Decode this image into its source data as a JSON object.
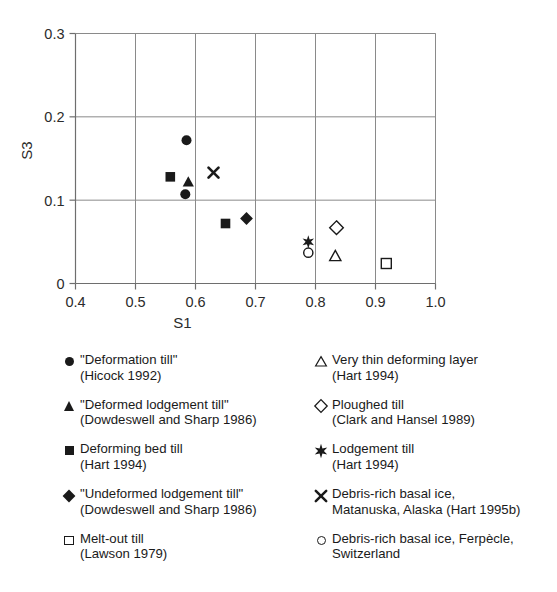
{
  "chart_data": {
    "type": "scatter",
    "title": "",
    "xlabel": "S1",
    "ylabel": "S3",
    "xlim": [
      0.4,
      1.0
    ],
    "ylim": [
      0.0,
      0.3
    ],
    "xticks": [
      "0.4",
      "0.5",
      "0.6",
      "0.7",
      "0.8",
      "0.9",
      "1.0"
    ],
    "yticks": [
      "0",
      "0.1",
      "0.2",
      "0.3"
    ],
    "grid": true,
    "legend_position": "below-plot-two-columns",
    "series": [
      {
        "name": "\"Deformation till\" (Hicock 1992)",
        "marker": "circle-filled",
        "points": [
          {
            "x": 0.585,
            "y": 0.172
          },
          {
            "x": 0.583,
            "y": 0.107
          }
        ]
      },
      {
        "name": "\"Deformed lodgement till\" (Dowdeswell and Sharp 1986)",
        "marker": "triangle-filled",
        "points": [
          {
            "x": 0.588,
            "y": 0.122
          }
        ]
      },
      {
        "name": "Deforming bed till (Hart 1994)",
        "marker": "square-filled",
        "points": [
          {
            "x": 0.558,
            "y": 0.128
          },
          {
            "x": 0.65,
            "y": 0.072
          }
        ]
      },
      {
        "name": "\"Undeformed lodgement till\" (Dowdeswell and Sharp 1986)",
        "marker": "diamond-filled",
        "points": [
          {
            "x": 0.685,
            "y": 0.078
          }
        ]
      },
      {
        "name": "Melt-out till (Lawson 1979)",
        "marker": "square-open",
        "points": [
          {
            "x": 0.918,
            "y": 0.024
          }
        ]
      },
      {
        "name": "Very thin deforming layer (Hart 1994)",
        "marker": "triangle-open",
        "points": [
          {
            "x": 0.833,
            "y": 0.033
          }
        ]
      },
      {
        "name": "Ploughed till (Clark and Hansel 1989)",
        "marker": "diamond-open",
        "points": [
          {
            "x": 0.835,
            "y": 0.067
          }
        ]
      },
      {
        "name": "Lodgement till (Hart 1994)",
        "marker": "star",
        "points": [
          {
            "x": 0.788,
            "y": 0.05
          }
        ]
      },
      {
        "name": "Debris-rich basal ice, Matanuska, Alaska (Hart 1995b)",
        "marker": "ex",
        "points": [
          {
            "x": 0.63,
            "y": 0.133
          }
        ]
      },
      {
        "name": "Debris-rich basal ice, Ferpècle, Switzerland",
        "marker": "circle-open",
        "points": [
          {
            "x": 0.788,
            "y": 0.037
          }
        ]
      }
    ]
  },
  "axes": {
    "x_title": "S1",
    "y_title": "S3",
    "x_tick_labels": [
      "0.4",
      "0.5",
      "0.6",
      "0.7",
      "0.8",
      "0.9",
      "1.0"
    ],
    "y_tick_labels": [
      "0",
      "0.1",
      "0.2",
      "0.3"
    ]
  },
  "legend": {
    "left_column": [
      {
        "marker": "circle-filled",
        "line1": "\"Deformation till\"",
        "line2": "(Hicock 1992)"
      },
      {
        "marker": "triangle-filled",
        "line1": "\"Deformed lodgement till\"",
        "line2": "(Dowdeswell and Sharp 1986)"
      },
      {
        "marker": "square-filled",
        "line1": "Deforming bed till",
        "line2": "(Hart 1994)"
      },
      {
        "marker": "diamond-filled",
        "line1": "\"Undeformed lodgement till\"",
        "line2": "(Dowdeswell and Sharp 1986)"
      },
      {
        "marker": "square-open",
        "line1": "Melt-out till",
        "line2": "(Lawson 1979)"
      }
    ],
    "right_column": [
      {
        "marker": "triangle-open",
        "line1": "Very thin deforming layer",
        "line2": "(Hart 1994)"
      },
      {
        "marker": "diamond-open",
        "line1": "Ploughed till",
        "line2": "(Clark and Hansel 1989)"
      },
      {
        "marker": "star",
        "line1": "Lodgement till",
        "line2": "(Hart 1994)"
      },
      {
        "marker": "ex",
        "line1": "Debris-rich basal ice,",
        "line2": "Matanuska, Alaska (Hart 1995b)"
      },
      {
        "marker": "circle-open",
        "line1": "Debris-rich basal ice, Ferpècle,",
        "line2": "Switzerland"
      }
    ]
  },
  "colors": {
    "ink": "#1a1a1a",
    "grid": "#8a8a8a",
    "axis": "#6e6e6e",
    "background": "#ffffff"
  }
}
